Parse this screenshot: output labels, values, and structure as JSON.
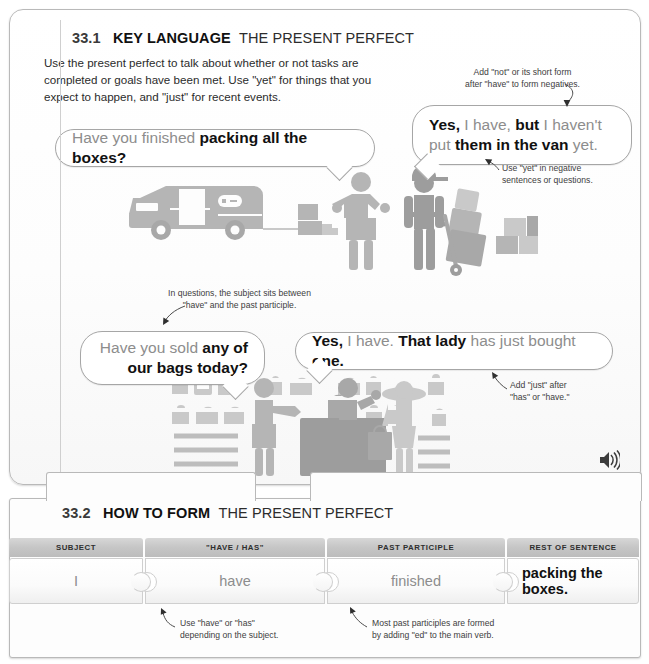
{
  "section_key": {
    "number": "33.1",
    "title_strong": "KEY LANGUAGE",
    "title_light": "THE PRESENT PERFECT",
    "intro": "Use the present perfect to talk about whether or not tasks are completed or goals have been met. Use \"yet\" for things that you expect to happen, and \"just\" for recent events.",
    "audio_icon": "speaker-icon"
  },
  "bubbles": [
    {
      "id": "have-you-finished",
      "parts": [
        {
          "text": "Have you finished ",
          "style": "gray"
        },
        {
          "text": "packing all the boxes?",
          "style": "bold"
        }
      ]
    },
    {
      "id": "yes-i-have-but",
      "parts": [
        {
          "text": "Yes,",
          "style": "bold"
        },
        {
          "text": " I have,",
          "style": "gray"
        },
        {
          "text": " but",
          "style": "bold"
        },
        {
          "text": " I haven't put",
          "style": "gray"
        },
        {
          "text": "them in the van",
          "style": "bold"
        },
        {
          "text": " yet.",
          "style": "gray"
        }
      ]
    },
    {
      "id": "have-you-sold",
      "parts": [
        {
          "text": "Have you sold ",
          "style": "gray"
        },
        {
          "text": "any of",
          "style": "bold"
        },
        {
          "text": "our bags today?",
          "style": "bold"
        }
      ]
    },
    {
      "id": "yes-that-lady",
      "parts": [
        {
          "text": "Yes,",
          "style": "bold"
        },
        {
          "text": " I have.",
          "style": "gray"
        },
        {
          "text": " That lady",
          "style": "bold"
        },
        {
          "text": " has just bought",
          "style": "gray"
        },
        {
          "text": " one.",
          "style": "bold"
        }
      ]
    }
  ],
  "annotations": {
    "not_form": "Add \"not\" or its short form\nafter \"have\" to form negatives.",
    "not_form_l1": "Add \"not\" or its short form",
    "not_form_l2": "after \"have\" to form negatives.",
    "yet_use_l1": "Use \"yet\" in negative",
    "yet_use_l2": "sentences or questions.",
    "subject_l1": "In questions, the subject sits between",
    "subject_l2": "\"have\" and the past participle.",
    "just_l1": "Add \"just\" after",
    "just_l2": "\"has\" or \"have.\"",
    "have_has_l1": "Use \"have\" or \"has\"",
    "have_has_l2": "depending on the subject.",
    "participle_l1": "Most past participles are formed",
    "participle_l2": "by adding \"ed\" to the main verb."
  },
  "section_form": {
    "number": "33.2",
    "title_strong": "HOW TO FORM",
    "title_light": "THE PRESENT PERFECT",
    "columns": [
      "SUBJECT",
      "\"HAVE / HAS\"",
      "PAST PARTICIPLE",
      "REST OF SENTENCE"
    ],
    "row": [
      {
        "value": "I",
        "style": "gray"
      },
      {
        "value": "have",
        "style": "gray"
      },
      {
        "value": "finished",
        "style": "gray"
      },
      {
        "value": "packing the boxes.",
        "style": "bold"
      }
    ]
  },
  "colors": {
    "gray_text": "#8d8d8d",
    "bold_text": "#111111",
    "panel_border": "#b9b9b9",
    "header_band": "#c6c6c6",
    "illustration": "#b5b5b5"
  }
}
